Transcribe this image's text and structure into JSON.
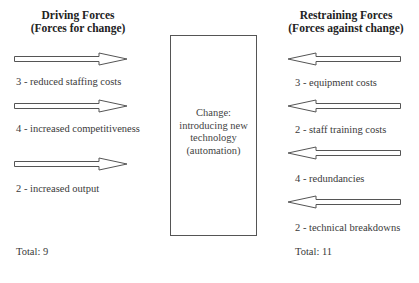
{
  "diagram": {
    "type": "force-field-analysis",
    "driving": {
      "title_line1": "Driving Forces",
      "title_line2": "(Forces for change)",
      "arrow_direction": "right",
      "forces": [
        {
          "label": "3 - reduced staffing costs",
          "score": 3,
          "text": "reduced staffing costs"
        },
        {
          "label": "4 - increased competitiveness",
          "score": 4,
          "text": "increased competitiveness"
        },
        {
          "label": "2 - increased output",
          "score": 2,
          "text": "increased output"
        }
      ],
      "total_label": "Total: 9",
      "total": 9
    },
    "change": {
      "line1": "Change:",
      "line2": "introducing new",
      "line3": "technology",
      "line4": "(automation)"
    },
    "restraining": {
      "title_line1": "Restraining Forces",
      "title_line2": "(Forces against change)",
      "arrow_direction": "left",
      "forces": [
        {
          "label": "3 - equipment costs",
          "score": 3,
          "text": "equipment costs"
        },
        {
          "label": "2 - staff training costs",
          "score": 2,
          "text": "staff training costs"
        },
        {
          "label": "4 - redundancies",
          "score": 4,
          "text": "redundancies"
        },
        {
          "label": "2 - technical breakdowns",
          "score": 2,
          "text": "technical breakdowns"
        }
      ],
      "total_label": "Total: 11",
      "total": 11
    },
    "colors": {
      "stroke": "#555555",
      "text": "#333333",
      "background": "#ffffff"
    }
  }
}
